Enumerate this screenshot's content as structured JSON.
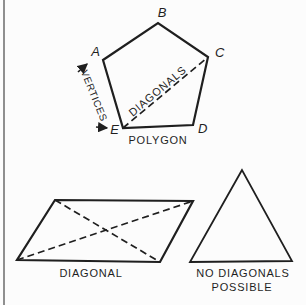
{
  "colors": {
    "bg": "#fcfcfc",
    "line": "#1f1f1f",
    "edge_bar": "#8f8f8f"
  },
  "pentagon": {
    "vertex_a": "A",
    "vertex_b": "B",
    "vertex_c": "C",
    "vertex_d": "D",
    "vertex_e": "E",
    "diagonal_label": "DIAGONALS",
    "vertices_label": "VERTICES",
    "caption": "POLYGON"
  },
  "parallelogram": {
    "caption": "DIAGONAL"
  },
  "triangle": {
    "caption_line_1": "NO DIAGONALS",
    "caption_line_2": "POSSIBLE"
  }
}
